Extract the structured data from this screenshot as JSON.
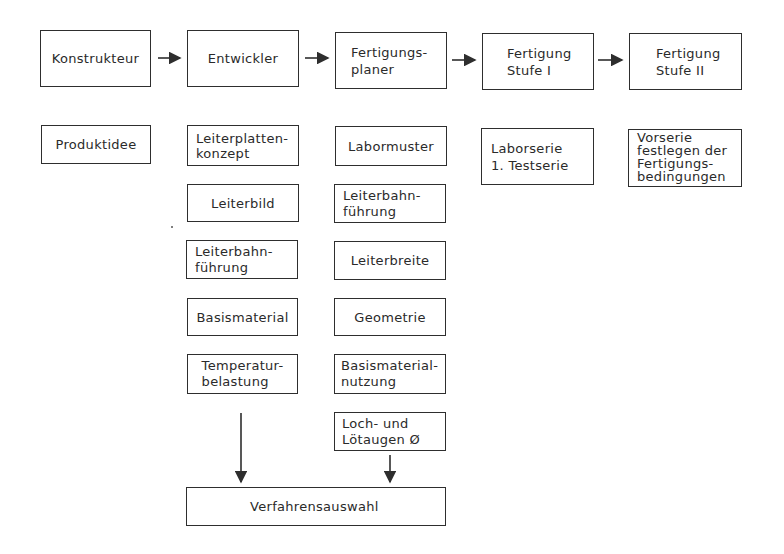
{
  "top_row": [
    {
      "label": "Konstrukteur"
    },
    {
      "label": "Entwickler"
    },
    {
      "label": "Fertigungs-\nplaner"
    },
    {
      "label": "Fertigung\nStufe I"
    },
    {
      "label": "Fertigung\nStufe II"
    }
  ],
  "konstrukteur_items": [
    {
      "label": "Produktidee"
    }
  ],
  "entwickler_items": [
    {
      "label": "Leiterplatten-\nkonzept"
    },
    {
      "label": "Leiterbild"
    },
    {
      "label": "Leiterbahn-\nführung"
    },
    {
      "label": "Basismaterial"
    },
    {
      "label": "Temperatur-\nbelastung"
    }
  ],
  "planer_items": [
    {
      "label": "Labormuster"
    },
    {
      "label": "Leiterbahn-\nführung"
    },
    {
      "label": "Leiterbreite"
    },
    {
      "label": "Geometrie"
    },
    {
      "label": "Basismaterial-\nnutzung"
    },
    {
      "label": "Loch- und\nLötaugen Ø"
    }
  ],
  "stufe1_items": [
    {
      "label": "Laborserie\n1. Testserie"
    }
  ],
  "stufe2_items": [
    {
      "label": "Vorserie\nfestlegen der\nFertigungs-\nbedingungen"
    }
  ],
  "result": {
    "label": "Verfahrensauswahl"
  },
  "colors": {
    "line": "#2e2e2e",
    "background": "#ffffff"
  }
}
